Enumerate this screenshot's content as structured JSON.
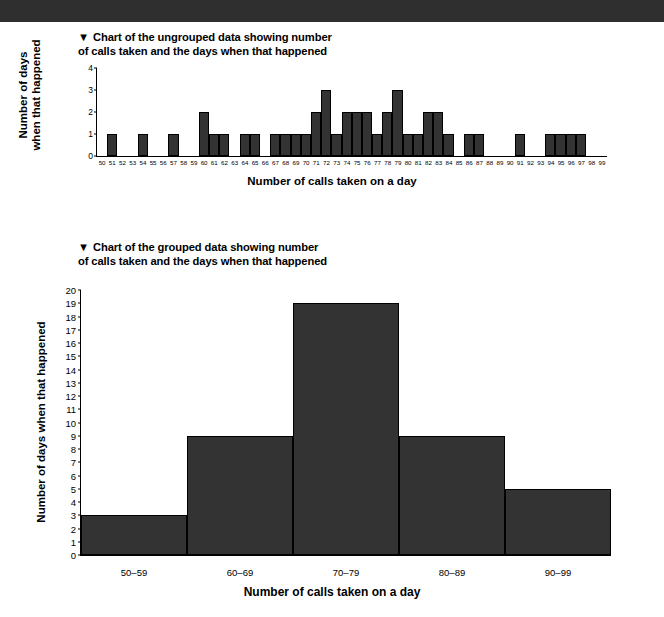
{
  "page": {
    "background_color": "#ffffff",
    "header_band_color": "#2f2f2f",
    "bar_color": "#333333",
    "axis_color": "#000000"
  },
  "figure1": {
    "title_marker": "▼",
    "title": "Chart of the ungrouped data showing number\nof calls taken and the days when that happened",
    "x_axis_title": "Number of calls taken on a day",
    "y_axis_title": "Number of days\nwhen that happened"
  },
  "figure2": {
    "title_marker": "▼",
    "title": "Chart of the grouped data showing number\nof calls taken and the days when that happened",
    "x_axis_title": "Number of calls taken on a day",
    "y_axis_title": "Number of days when that happened"
  },
  "chart_data": [
    {
      "type": "bar",
      "id": "ungrouped-calls-histogram",
      "title": "Chart of the ungrouped data showing number of calls taken and the days when that happened",
      "xlabel": "Number of calls taken on a day",
      "ylabel": "Number of days when that happened",
      "ylim": [
        0,
        4
      ],
      "yticks": [
        0,
        1,
        2,
        3,
        4
      ],
      "grid": false,
      "legend": null,
      "categories": [
        50,
        51,
        52,
        53,
        54,
        55,
        56,
        57,
        58,
        59,
        60,
        61,
        62,
        63,
        64,
        65,
        66,
        67,
        68,
        69,
        70,
        71,
        72,
        73,
        74,
        75,
        76,
        77,
        78,
        79,
        80,
        81,
        82,
        83,
        84,
        85,
        86,
        87,
        88,
        89,
        90,
        91,
        92,
        93,
        94,
        95,
        96,
        97,
        98,
        99
      ],
      "values": [
        0,
        1,
        0,
        0,
        1,
        0,
        0,
        1,
        0,
        0,
        2,
        1,
        1,
        0,
        1,
        1,
        0,
        1,
        1,
        1,
        1,
        2,
        3,
        1,
        2,
        2,
        2,
        1,
        2,
        3,
        1,
        1,
        2,
        2,
        1,
        0,
        1,
        1,
        0,
        0,
        0,
        1,
        0,
        0,
        1,
        1,
        1,
        1,
        0,
        0
      ]
    },
    {
      "type": "bar",
      "id": "grouped-calls-histogram",
      "title": "Chart of the grouped data showing number of calls taken and the days when that happened",
      "xlabel": "Number of calls taken on a day",
      "ylabel": "Number of days when that happened",
      "ylim": [
        0,
        20
      ],
      "yticks": [
        0,
        1,
        2,
        3,
        4,
        5,
        6,
        7,
        8,
        9,
        10,
        11,
        12,
        13,
        14,
        15,
        16,
        17,
        18,
        19,
        20
      ],
      "grid": false,
      "legend": null,
      "categories": [
        "50–59",
        "60–69",
        "70–79",
        "80–89",
        "90–99"
      ],
      "values": [
        3,
        9,
        19,
        9,
        5
      ]
    }
  ]
}
